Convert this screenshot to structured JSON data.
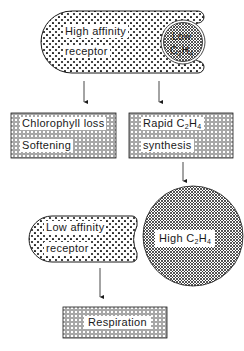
{
  "diagram": {
    "top_receptor": {
      "label_line1": "High affinity",
      "label_line2": "receptor"
    },
    "low_ethylene": {
      "label_line1": "Low",
      "label_line2_pre": "C",
      "sub1": "2",
      "mid": "H",
      "sub2": "4"
    },
    "box_left": {
      "label_line1": "Chlorophyll loss",
      "label_line2": "Softening"
    },
    "box_right": {
      "label_line1_pre": "Rapid C",
      "sub1": "2",
      "mid": "H",
      "sub2": "4",
      "label_line2": "synthesis"
    },
    "low_receptor": {
      "label_line1": "Low affinity",
      "label_line2": "receptor"
    },
    "high_ethylene": {
      "label_pre": "High C",
      "sub1": "2",
      "mid": "H",
      "sub2": "4"
    },
    "bottom_box": {
      "label": "Respiration"
    },
    "colors": {
      "ink": "#1a1a1a",
      "fill": "#ffffff"
    }
  }
}
